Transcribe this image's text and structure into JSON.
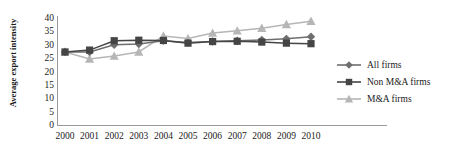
{
  "chart_data": {
    "type": "line",
    "title": "",
    "xlabel": "",
    "ylabel": "Average export intensity",
    "categories": [
      "2000",
      "2001",
      "2002",
      "2003",
      "2004",
      "2005",
      "2006",
      "2007",
      "2008",
      "2009",
      "2010"
    ],
    "ylim": [
      0,
      40
    ],
    "yticks": [
      0,
      5,
      10,
      15,
      20,
      25,
      30,
      35,
      40
    ],
    "grid": false,
    "legend_position": "right",
    "series": [
      {
        "name": "All firms",
        "marker": "diamond",
        "color": "#6e6e6e",
        "values": [
          27.3,
          27.3,
          30.0,
          30.3,
          31.5,
          30.8,
          31.2,
          31.5,
          31.8,
          32.2,
          33.0
        ]
      },
      {
        "name": "Non M&A firms",
        "marker": "square",
        "color": "#454545",
        "values": [
          27.3,
          28.0,
          31.5,
          31.7,
          31.6,
          30.6,
          31.2,
          31.3,
          31.0,
          30.6,
          30.4
        ]
      },
      {
        "name": "M&A firms",
        "marker": "triangle",
        "color": "#b6b6b6",
        "values": [
          27.3,
          24.7,
          25.8,
          27.3,
          33.3,
          32.3,
          34.4,
          35.2,
          36.2,
          37.6,
          38.8
        ]
      }
    ]
  },
  "axis": {
    "y_title": "Average export intensity",
    "y_tick_labels": [
      "40",
      "35",
      "30",
      "25",
      "20",
      "15",
      "10",
      "5",
      "0"
    ],
    "x_tick_labels": [
      "2000",
      "2001",
      "2002",
      "2003",
      "2004",
      "2005",
      "2006",
      "2007",
      "2008",
      "2009",
      "2010"
    ]
  },
  "legend": {
    "items": [
      {
        "label": "All firms",
        "color": "#6e6e6e",
        "marker": "diamond"
      },
      {
        "label": "Non M&A firms",
        "color": "#454545",
        "marker": "square"
      },
      {
        "label": "M&A firms",
        "color": "#b6b6b6",
        "marker": "triangle"
      }
    ]
  }
}
